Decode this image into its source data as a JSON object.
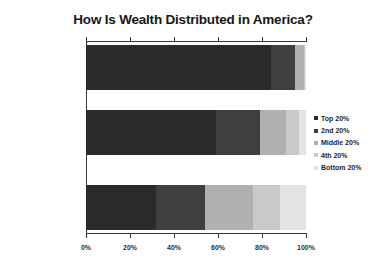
{
  "chart_data": {
    "type": "bar",
    "orientation": "horizontal",
    "stacked": true,
    "normalized_percent": true,
    "title": "How Is Wealth Distributed in America?",
    "xlabel": "",
    "ylabel": "",
    "categories": [
      "The Reality",
      "What People Think",
      "“Ideal”"
    ],
    "series": [
      {
        "name": "Top 20%",
        "color": "#2b2b2b",
        "values": [
          84.0,
          59.0,
          32.0
        ]
      },
      {
        "name": "2nd 20%",
        "color": "#3f3f3f",
        "values": [
          11.0,
          20.0,
          22.0
        ]
      },
      {
        "name": "Middle 20%",
        "color": "#b0b0b0",
        "values": [
          4.0,
          12.0,
          22.0
        ]
      },
      {
        "name": "4th 20%",
        "color": "#c9c9c9",
        "values": [
          0.7,
          6.0,
          12.0
        ]
      },
      {
        "name": "Bottom 20%",
        "color": "#e3e3e3",
        "values": [
          0.3,
          3.0,
          12.0
        ]
      }
    ],
    "xlim": [
      0,
      100
    ],
    "xticks": [
      0,
      20,
      40,
      60,
      80,
      100
    ],
    "xtick_labels": [
      "0%",
      "20%",
      "40%",
      "60%",
      "80%",
      "100%"
    ],
    "grid": false,
    "legend_position": "right"
  },
  "legend": {
    "items": [
      {
        "label": "Top 20%",
        "color": "#2b2b2b"
      },
      {
        "label": "2nd 20%",
        "color": "#3f3f3f"
      },
      {
        "label": "Middle 20%",
        "color": "#b0b0b0"
      },
      {
        "label": "4th 20%",
        "color": "#c9c9c9"
      },
      {
        "label": "Bottom 20%",
        "color": "#e3e3e3"
      }
    ]
  }
}
